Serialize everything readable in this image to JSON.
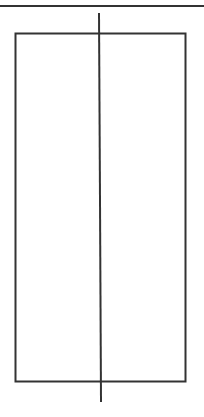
{
  "diagram": {
    "width": 204,
    "height": 417,
    "background": "#ffffff",
    "stroke_color": "#333333",
    "shapes": {
      "top_line": {
        "x1": 0,
        "y1": 6,
        "x2": 204,
        "y2": 6,
        "stroke_width": 2
      },
      "rectangle": {
        "x": 15.5,
        "y": 33.5,
        "width": 170,
        "height": 348,
        "stroke_width": 2
      },
      "vertical_line_upper": {
        "x1": 99,
        "y1": 13,
        "x2": 100,
        "y2": 200,
        "stroke_width": 2
      },
      "vertical_line_lower": {
        "x1": 100,
        "y1": 200,
        "x2": 101,
        "y2": 402,
        "stroke_width": 2
      }
    }
  }
}
